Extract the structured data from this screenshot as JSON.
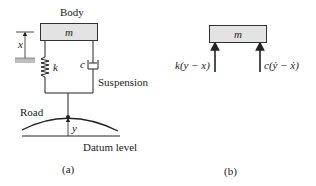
{
  "figure_a": {
    "body_label": "Body",
    "mass_label": "m",
    "displacement_label": "x",
    "spring_label": "k",
    "damper_label": "c",
    "suspension_label": "Suspension",
    "road_label": "Road",
    "road_displacement_label": "y",
    "datum_label": "Datum level",
    "caption": "(a)"
  },
  "figure_b": {
    "mass_label": "m",
    "spring_force_label": "k(y − x)",
    "damper_force_label": "c(ẏ − ẋ)",
    "caption": "(b)"
  },
  "colors": {
    "mass_fill": "#e3e3e3",
    "line": "#222222",
    "ground_hatch": "#bdbdbd"
  }
}
